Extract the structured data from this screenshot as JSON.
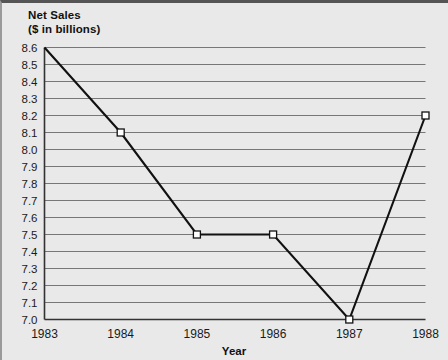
{
  "chart_data": {
    "type": "line",
    "title": "Net Sales",
    "subtitle": "($ in billions)",
    "xlabel": "Year",
    "ylabel": "",
    "categories": [
      "1983",
      "1984",
      "1985",
      "1986",
      "1987",
      "1988"
    ],
    "x": [
      1983,
      1984,
      1985,
      1986,
      1987,
      1988
    ],
    "values": [
      8.6,
      8.1,
      7.5,
      7.5,
      7.0,
      8.2
    ],
    "series": [
      {
        "name": "Net Sales",
        "values": [
          8.6,
          8.1,
          7.5,
          7.5,
          7.0,
          8.2
        ]
      }
    ],
    "ylim": [
      7.0,
      8.6
    ],
    "xlim": [
      1983,
      1988
    ],
    "ytick_step": 0.1,
    "yticks": [
      "8.6",
      "8.5",
      "8.4",
      "8.3",
      "8.2",
      "8.1",
      "8.0",
      "7.9",
      "7.8",
      "7.7",
      "7.6",
      "7.5",
      "7.4",
      "7.3",
      "7.2",
      "7.1",
      "7.0"
    ],
    "ytick_values": [
      8.6,
      8.5,
      8.4,
      8.3,
      8.2,
      8.1,
      8.0,
      7.9,
      7.8,
      7.7,
      7.6,
      7.5,
      7.4,
      7.3,
      7.2,
      7.1,
      7.0
    ],
    "xticks": [
      "1983",
      "1984",
      "1985",
      "1986",
      "1987",
      "1988"
    ],
    "grid": "horizontal",
    "legend": "none",
    "marker": "open-square",
    "colors": {
      "background": "#e9e9e9",
      "gridline": "#777777",
      "axis": "#333333",
      "line": "#111111",
      "marker_fill": "#ffffff",
      "marker_edge": "#111111",
      "text": "#1a1a1a"
    }
  }
}
